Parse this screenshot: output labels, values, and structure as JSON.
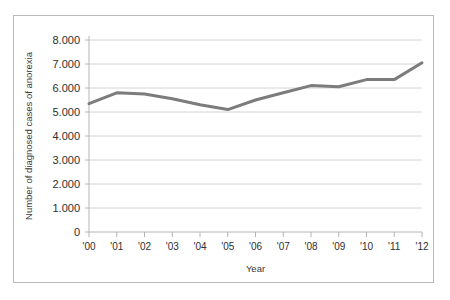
{
  "chart_data": {
    "type": "line",
    "title": "",
    "xlabel": "Year",
    "ylabel": "Number of diagnosed cases of anorexia",
    "categories": [
      "'00",
      "'01",
      "'02",
      "'03",
      "'04",
      "'05",
      "'06",
      "'07",
      "'08",
      "'09",
      "'10",
      "'11",
      "'12"
    ],
    "values": [
      5350,
      5800,
      5750,
      5550,
      5300,
      5100,
      5500,
      5800,
      6100,
      6050,
      6350,
      6350,
      7050
    ],
    "series": [
      {
        "name": "Number of diagnosed cases of anorexia",
        "values": [
          5350,
          5800,
          5750,
          5550,
          5300,
          5100,
          5500,
          5800,
          6100,
          6050,
          6350,
          6350,
          7050
        ]
      }
    ],
    "ylim": [
      0,
      8000
    ],
    "ytick_values": [
      0,
      1000,
      2000,
      3000,
      4000,
      5000,
      6000,
      7000,
      8000
    ],
    "ytick_labels": [
      "0",
      "1.000",
      "2.000",
      "3.000",
      "4.000",
      "5.000",
      "6.000",
      "7.000",
      "8.000"
    ],
    "xtick_labels": [
      "'00",
      "'01",
      "'02",
      "'03",
      "'04",
      "'05",
      "'06",
      "'07",
      "'08",
      "'09",
      "'10",
      "'11",
      "'12"
    ],
    "grid": true,
    "grid_axis": "y",
    "legend": false,
    "legend_position": "none",
    "line_color": "#7c7c7c",
    "grid_color": "#d4d4d4",
    "axis_color": "#b5b5b5",
    "border_color": "#b9b9b9",
    "background_color": "#ffffff",
    "line_width": 3
  }
}
